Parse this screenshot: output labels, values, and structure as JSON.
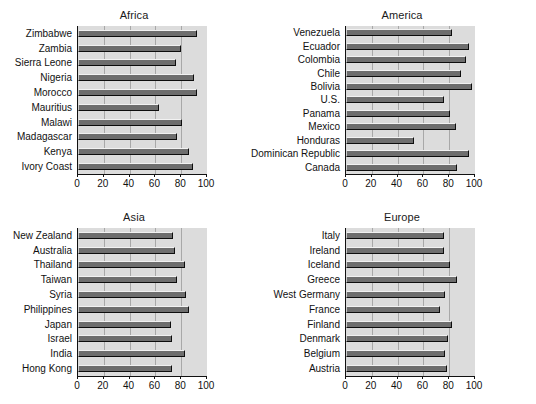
{
  "figure": {
    "background": "#ffffff",
    "plot_background": "#dcdcdc",
    "bar_color": "#6e6e6e",
    "gridline_color": "#a8a8a8",
    "axis_color": "#111111"
  },
  "chart_data": [
    {
      "type": "bar",
      "orientation": "horizontal",
      "title": "Africa",
      "xlabel": "",
      "ylabel": "",
      "xlim": [
        0,
        100
      ],
      "xticks": [
        0,
        20,
        40,
        60,
        80,
        100
      ],
      "grid": "vertical",
      "legend": "none",
      "categories": [
        "Zimbabwe",
        "Zambia",
        "Sierra Leone",
        "Nigeria",
        "Morocco",
        "Mauritius",
        "Malawi",
        "Madagascar",
        "Kenya",
        "Ivory Coast"
      ],
      "values": [
        92,
        80,
        76,
        90,
        92,
        63,
        81,
        77,
        86,
        89
      ]
    },
    {
      "type": "bar",
      "orientation": "horizontal",
      "title": "America",
      "xlabel": "",
      "ylabel": "",
      "xlim": [
        0,
        100
      ],
      "xticks": [
        0,
        20,
        40,
        60,
        80,
        100
      ],
      "grid": "vertical",
      "legend": "none",
      "categories": [
        "Venezuela",
        "Ecuador",
        "Colombia",
        "Chile",
        "Bolivia",
        "U.S.",
        "Panama",
        "Mexico",
        "Honduras",
        "Dominican Republic",
        "Canada"
      ],
      "values": [
        82,
        95,
        93,
        89,
        98,
        76,
        81,
        85,
        53,
        95,
        86
      ]
    },
    {
      "type": "bar",
      "orientation": "horizontal",
      "title": "Asia",
      "xlabel": "",
      "ylabel": "",
      "xlim": [
        0,
        100
      ],
      "xticks": [
        0,
        20,
        40,
        60,
        80,
        100
      ],
      "grid": "vertical",
      "legend": "none",
      "categories": [
        "New Zealand",
        "Australia",
        "Thailand",
        "Taiwan",
        "Syria",
        "Philippines",
        "Japan",
        "Israel",
        "India",
        "Hong Kong"
      ],
      "values": [
        74,
        75,
        83,
        77,
        84,
        86,
        72,
        73,
        83,
        73
      ]
    },
    {
      "type": "bar",
      "orientation": "horizontal",
      "title": "Europe",
      "xlabel": "",
      "ylabel": "",
      "xlim": [
        0,
        100
      ],
      "xticks": [
        0,
        20,
        40,
        60,
        80,
        100
      ],
      "grid": "vertical",
      "legend": "none",
      "categories": [
        "Italy",
        "Ireland",
        "Iceland",
        "Greece",
        "West Germany",
        "France",
        "Finland",
        "Denmark",
        "Belgium",
        "Austria"
      ],
      "values": [
        76,
        76,
        81,
        86,
        77,
        73,
        82,
        79,
        77,
        78
      ]
    }
  ]
}
